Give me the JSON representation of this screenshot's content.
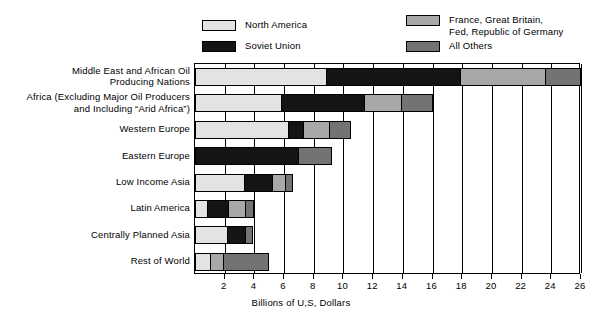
{
  "legend": {
    "entries": [
      {
        "id": "north-america",
        "label": "North America",
        "color": "#e3e3e3"
      },
      {
        "id": "soviet-union",
        "label": "Soviet Union",
        "color": "#141414"
      },
      {
        "id": "france-gb-frg",
        "label": "France, Great Britain,\nFed, Republic of Germany",
        "color": "#a8a8a8"
      },
      {
        "id": "all-others",
        "label": "All Others",
        "color": "#737373"
      }
    ]
  },
  "chart_data": {
    "type": "bar",
    "orientation": "horizontal",
    "stacked": true,
    "title": "",
    "xlabel": "Billions of U,S, Dollars",
    "ylabel": "",
    "xlim": [
      0,
      26
    ],
    "xticks": [
      2,
      4,
      6,
      8,
      10,
      12,
      14,
      16,
      18,
      20,
      22,
      24,
      26
    ],
    "xticklabels": [
      "2",
      "4",
      "6",
      "8",
      "10",
      "12",
      "14",
      "16",
      "18",
      "20",
      "22",
      "24",
      "26"
    ],
    "grid": true,
    "legend_position": "top",
    "categories": [
      "Middle East and African Oil\nProducing Nations",
      "Africa (Excluding Major Oil Producers\nand Including “Arid Africa”)",
      "Western Europe",
      "Eastern Europe",
      "Low Income Asia",
      "Latin America",
      "Centrally Planned Asia",
      "Rest of World"
    ],
    "series": [
      {
        "name": "North America",
        "color": "#e3e3e3",
        "values": [
          8.8,
          5.8,
          6.3,
          0.0,
          3.3,
          0.8,
          2.2,
          1.0
        ]
      },
      {
        "name": "Soviet Union",
        "color": "#141414",
        "values": [
          9.1,
          5.6,
          1.0,
          7.0,
          1.9,
          1.4,
          1.2,
          0.0
        ]
      },
      {
        "name": "France, Great Britain, Fed, Republic of Germany",
        "color": "#a8a8a8",
        "values": [
          5.7,
          2.5,
          1.8,
          0.0,
          0.9,
          1.2,
          0.0,
          0.9
        ]
      },
      {
        "name": "All Others",
        "color": "#737373",
        "values": [
          2.4,
          2.1,
          1.4,
          2.2,
          0.5,
          0.6,
          0.5,
          3.1
        ]
      }
    ],
    "totals": [
      26.0,
      16.0,
      10.5,
      9.2,
      6.6,
      4.0,
      3.9,
      5.0
    ]
  }
}
